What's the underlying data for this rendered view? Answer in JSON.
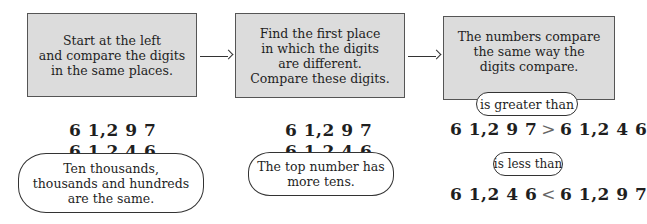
{
  "steps": [
    {
      "lines": [
        "Start at the left",
        "and compare the digits",
        "in the same places."
      ],
      "numbers": [
        "6 1,2 9 7",
        "6 1,2 4 6"
      ],
      "note": [
        "Ten thousands,",
        "thousands and hundreds",
        "are the same."
      ]
    },
    {
      "lines": [
        "Find the first place",
        "in which the digits",
        "are different.",
        "Compare these digits."
      ],
      "numbers": [
        "6 1,2 9 7",
        "6 1,2 4 6"
      ],
      "note": [
        "The top number has",
        "more tens."
      ]
    },
    {
      "lines": [
        "The numbers compare",
        "the same way the",
        "digits compare."
      ],
      "comparisons": [
        {
          "label": "is greater than",
          "left": "6 1,2 9 7",
          "symbol": ">",
          "right": "6 1,2 4 6"
        },
        {
          "label": "is less than",
          "left": "6 1,2 4 6",
          "symbol": "<",
          "right": "6 1,2 9 7"
        }
      ]
    }
  ],
  "arrows": [
    "arrow-right-icon",
    "arrow-right-icon"
  ],
  "colors": {
    "box_fill": "#dcdcdc",
    "box_border": "#555555",
    "text": "#1f1f1f",
    "symbol": "#666666"
  }
}
